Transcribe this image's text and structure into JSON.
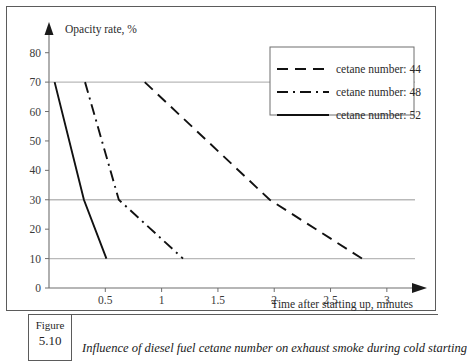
{
  "figure": {
    "label_word": "Figure",
    "number": "5.10",
    "caption": "Influence of diesel fuel cetane number on exhaust smoke during cold starting"
  },
  "chart_data": {
    "type": "line",
    "title": "",
    "ylabel": "Opacity rate, %",
    "xlabel": "Time after starting up, minutes",
    "xlim": [
      0,
      3.25
    ],
    "ylim": [
      0,
      85
    ],
    "xticks": [
      0.5,
      1,
      1.5,
      2,
      2.5,
      3
    ],
    "xtick_labels": [
      "0.5",
      "1",
      "1.5",
      "2",
      "2.5",
      "3"
    ],
    "yticks": [
      0,
      10,
      20,
      30,
      40,
      50,
      60,
      70,
      80
    ],
    "ytick_labels": [
      "0",
      "10",
      "20",
      "30",
      "40",
      "50",
      "60",
      "70",
      "80"
    ],
    "gridlines_y": [
      10,
      30,
      70
    ],
    "grid": true,
    "legend_position": "top-right",
    "series": [
      {
        "name": "cetane number: 44",
        "dash": "dashed",
        "points": [
          [
            0.85,
            70
          ],
          [
            1.96,
            30
          ],
          [
            2.78,
            10
          ]
        ]
      },
      {
        "name": "cetane number: 48",
        "dash": "dash-dot",
        "points": [
          [
            0.32,
            70
          ],
          [
            0.62,
            30
          ],
          [
            1.19,
            10
          ]
        ]
      },
      {
        "name": "cetane number: 52",
        "dash": "solid",
        "points": [
          [
            0.05,
            70
          ],
          [
            0.31,
            30
          ],
          [
            0.51,
            10
          ]
        ]
      }
    ]
  },
  "legend": {
    "entries": [
      {
        "label": "cetane number: 44",
        "dash": "dashed"
      },
      {
        "label": "cetane number: 48",
        "dash": "dash-dot"
      },
      {
        "label": "cetane number: 52",
        "dash": "solid"
      }
    ]
  },
  "colors": {
    "line": "#111111",
    "grid": "#b9b9b9",
    "axis": "#6e6e6e",
    "frame": "#5b5b5b",
    "text": "#2b2b2b"
  }
}
